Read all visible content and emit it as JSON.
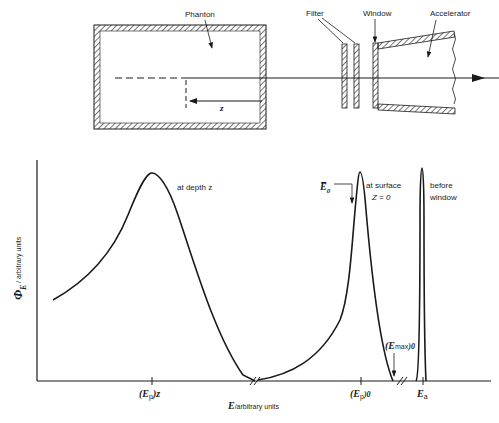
{
  "schematic": {
    "labels": {
      "phantom": "Phanton",
      "filter": "Filter",
      "window": "Window",
      "accelerator": "Accelerator",
      "depth": "z"
    }
  },
  "plot": {
    "ylabel_symbol": "Φ",
    "ylabel_sub": "E",
    "ylabel_units": "/ arbitrary units",
    "xlabel_symbol": "E",
    "xlabel_units": "/arbitrary units",
    "curves": {
      "depth": "at depth z",
      "surface_line1": "at surface",
      "surface_line2": "Z = 0",
      "before_line1": "before",
      "before_line2": "window"
    },
    "annotations": {
      "mean_energy": "E̅",
      "mean_energy_sub": "0",
      "emax": "(E",
      "emax_sub": "max",
      "emax_close": ")0"
    },
    "ticks": {
      "ep_z": "(E",
      "ep_z_sub": "p",
      "ep_z_close": ")z",
      "ep_0": "(E",
      "ep_0_sub": "p",
      "ep_0_close": ")0",
      "ea": "E",
      "ea_sub": "a"
    }
  }
}
